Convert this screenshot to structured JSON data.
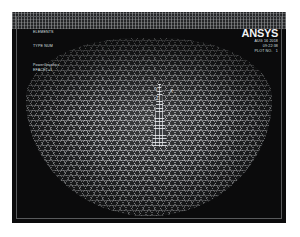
{
  "window": {
    "background_color": "#0b0b0c",
    "frame_color": "#585a5c"
  },
  "annotations": {
    "title_block": "ELEMENTS",
    "view_block": "TYPE NUM",
    "graphics_block": "PowerGraphics\nEFACET=1",
    "logo": "ANSYS",
    "stamp": "AUG 16 2018\n09:22:38\nPLOT NO.   1"
  },
  "axis_triad": {
    "y_label": "Y",
    "x_label": "X",
    "z_label": "Z"
  },
  "mesh": {
    "wireframe_color": "#d6d8db",
    "body_color": "#1c1d1f",
    "column_color": "#eceef1"
  }
}
